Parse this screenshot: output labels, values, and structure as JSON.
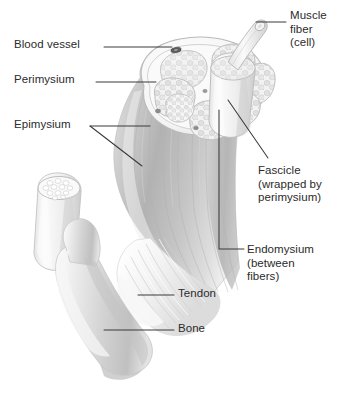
{
  "figure": {
    "background_color": "#ffffff",
    "text_color": "#2b2b2b",
    "leader_color": "#3a3a3a",
    "art_style": "grayscale pencil-shaded anatomical illustration"
  },
  "labels": {
    "blood_vessel": {
      "text": "Blood vessel",
      "side": "left",
      "x": 14,
      "y": 38
    },
    "perimysium": {
      "text": "Perimysium",
      "side": "left",
      "x": 14,
      "y": 73
    },
    "epimysium": {
      "text": "Epimysium",
      "side": "left",
      "x": 14,
      "y": 118
    },
    "muscle_fiber": {
      "text": "Muscle\nfiber\n(cell)",
      "side": "right",
      "x": 290,
      "y": 9
    },
    "fascicle": {
      "text": "Fascicle\n(wrapped by\nperimysium)",
      "side": "right",
      "x": 258,
      "y": 164
    },
    "endomysium": {
      "text": "Endomysium\n(between\nfibers)",
      "side": "right",
      "x": 247,
      "y": 243
    },
    "tendon": {
      "text": "Tendon",
      "side": "right",
      "x": 178,
      "y": 287
    },
    "bone": {
      "text": "Bone",
      "side": "right",
      "x": 178,
      "y": 322
    }
  },
  "structures": [
    {
      "name": "muscle-belly",
      "description": "cut cylindrical skeletal muscle body angled down-left"
    },
    {
      "name": "muscle-cross-section",
      "description": "oval cut face showing seven fascicles in epimysium sheath"
    },
    {
      "name": "fascicle-bundles",
      "count": 7,
      "description": "rounded polygonal bundles each filled with muscle fibers"
    },
    {
      "name": "raised-fascicle",
      "description": "one fascicle pulled forward as an upright cylinder"
    },
    {
      "name": "single-muscle-fiber",
      "description": "one fiber drawn out of the raised fascicle toward upper right"
    },
    {
      "name": "isolated-fascicle",
      "description": "detached fascicle cylinder at lower left showing fiber cross-section"
    },
    {
      "name": "blood-vessel-spot",
      "description": "small dark vessel within the perimysium at the cut face"
    },
    {
      "name": "tendon",
      "description": "pale fibrous cords converging from muscle onto bone"
    },
    {
      "name": "bone",
      "description": "long bone shaft running down the lower left"
    }
  ]
}
